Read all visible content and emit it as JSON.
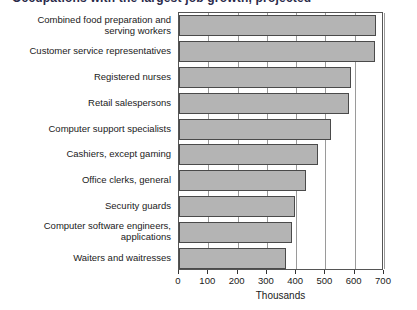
{
  "chart": {
    "title": "Occupations with the largest job growth, projected",
    "axis_title": "Thousands",
    "bar_fill": "#b4b4b4",
    "bar_border": "#4a4a4a",
    "grid_color": "#9a9a9a"
  },
  "chart_data": {
    "type": "bar",
    "orientation": "horizontal",
    "title": "Occupations with the largest job growth, projected",
    "xlabel": "Thousands",
    "ylabel": "",
    "xlim": [
      0,
      700
    ],
    "xticks": [
      0,
      100,
      200,
      300,
      400,
      500,
      600,
      700
    ],
    "tick_labels": [
      "0",
      "100",
      "200",
      "300",
      "400",
      "500",
      "600",
      "700"
    ],
    "grid": true,
    "legend": "none",
    "categories": [
      "Combined food preparation and\nserving workers",
      "Customer service representatives",
      "Registered nurses",
      "Retail salespersons",
      "Computer support specialists",
      "Cashiers, except gaming",
      "Office clerks, general",
      "Security guards",
      "Computer software engineers,\napplications",
      "Waiters and waitresses"
    ],
    "values": [
      673,
      669,
      587,
      581,
      520,
      474,
      435,
      397,
      385,
      367
    ]
  }
}
